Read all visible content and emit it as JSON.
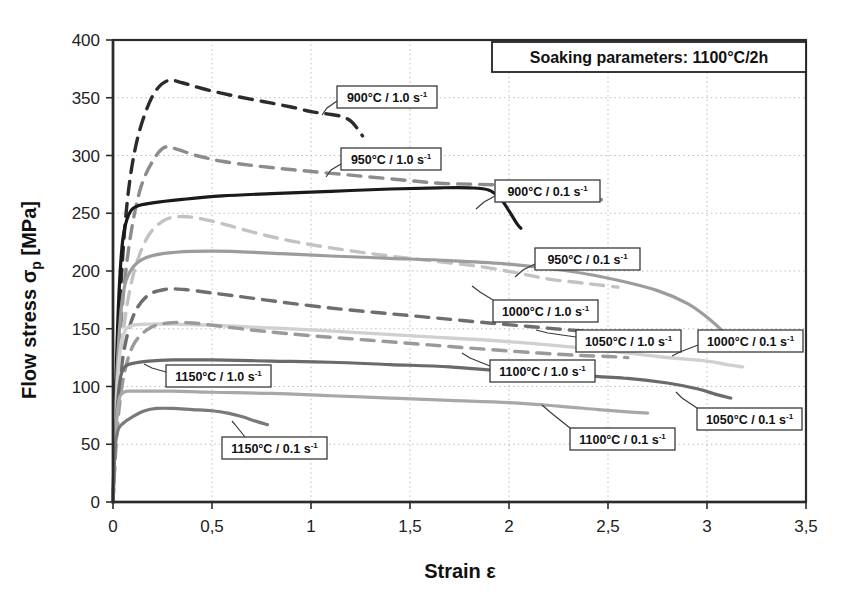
{
  "chart_data": {
    "type": "line",
    "title": "Soaking parameters:  1100°C/2h",
    "xlabel": "Strain ε",
    "ylabel": "Flow stress σp [MPa]",
    "xlim": [
      0,
      3.5
    ],
    "ylim": [
      0,
      400
    ],
    "xticks": [
      "0",
      "0,5",
      "1",
      "1,5",
      "2",
      "2,5",
      "3",
      "3,5"
    ],
    "xtick_values": [
      0,
      0.5,
      1,
      1.5,
      2,
      2.5,
      3,
      3.5
    ],
    "yticks": [
      "0",
      "50",
      "100",
      "150",
      "200",
      "250",
      "300",
      "350",
      "400"
    ],
    "ytick_values": [
      0,
      50,
      100,
      150,
      200,
      250,
      300,
      350,
      400
    ],
    "grid": true,
    "legend_position": "inline-callouts",
    "series": [
      {
        "name": "900°C / 1.0 s",
        "label": "900°C / 1.0 s",
        "exponent": "-1",
        "color": "#2b2b2b",
        "width": 3.4,
        "dash": "13 9",
        "points": [
          [
            0,
            0
          ],
          [
            0.02,
            120
          ],
          [
            0.05,
            215
          ],
          [
            0.08,
            272
          ],
          [
            0.12,
            312
          ],
          [
            0.17,
            340
          ],
          [
            0.22,
            357
          ],
          [
            0.28,
            365
          ],
          [
            0.35,
            363
          ],
          [
            0.45,
            358
          ],
          [
            0.6,
            352
          ],
          [
            0.75,
            347
          ],
          [
            0.9,
            342
          ],
          [
            1.0,
            338
          ],
          [
            1.08,
            336
          ],
          [
            1.15,
            334
          ],
          [
            1.2,
            330
          ],
          [
            1.24,
            322
          ],
          [
            1.26,
            317
          ]
        ]
      },
      {
        "name": "950°C / 1.0 s",
        "label": "950°C / 1.0 s",
        "exponent": "-1",
        "color": "#8c8c8c",
        "width": 3.4,
        "dash": "13 9",
        "points": [
          [
            0,
            0
          ],
          [
            0.02,
            95
          ],
          [
            0.05,
            175
          ],
          [
            0.09,
            232
          ],
          [
            0.14,
            272
          ],
          [
            0.2,
            295
          ],
          [
            0.26,
            307
          ],
          [
            0.33,
            305
          ],
          [
            0.42,
            300
          ],
          [
            0.55,
            295
          ],
          [
            0.72,
            291
          ],
          [
            0.95,
            287
          ],
          [
            1.2,
            283
          ],
          [
            1.45,
            279
          ],
          [
            1.65,
            276
          ],
          [
            1.85,
            275
          ],
          [
            2.0,
            274
          ],
          [
            2.15,
            272
          ],
          [
            2.3,
            268
          ],
          [
            2.42,
            263
          ],
          [
            2.5,
            261
          ]
        ]
      },
      {
        "name": "900°C / 0.1 s",
        "label": "900°C / 0.1 s",
        "exponent": "-1",
        "color": "#1a1a1a",
        "width": 3.2,
        "dash": "none",
        "points": [
          [
            0,
            0
          ],
          [
            0.015,
            105
          ],
          [
            0.03,
            180
          ],
          [
            0.05,
            228
          ],
          [
            0.08,
            249
          ],
          [
            0.12,
            256
          ],
          [
            0.2,
            259
          ],
          [
            0.35,
            262
          ],
          [
            0.55,
            265
          ],
          [
            0.8,
            267
          ],
          [
            1.1,
            269
          ],
          [
            1.4,
            271
          ],
          [
            1.65,
            272
          ],
          [
            1.8,
            272
          ],
          [
            1.9,
            270
          ],
          [
            1.96,
            262
          ],
          [
            2.0,
            252
          ],
          [
            2.04,
            241
          ],
          [
            2.06,
            237
          ]
        ]
      },
      {
        "name": "950°C / 0.1 s",
        "label": "950°C / 0.1 s",
        "exponent": "-1",
        "color": "#c2c2c2",
        "width": 3.4,
        "dash": "13 9",
        "points": [
          [
            0,
            0
          ],
          [
            0.02,
            80
          ],
          [
            0.05,
            145
          ],
          [
            0.1,
            195
          ],
          [
            0.17,
            228
          ],
          [
            0.25,
            243
          ],
          [
            0.33,
            247
          ],
          [
            0.42,
            246
          ],
          [
            0.55,
            241
          ],
          [
            0.72,
            233
          ],
          [
            0.9,
            226
          ],
          [
            1.1,
            220
          ],
          [
            1.35,
            214
          ],
          [
            1.6,
            209
          ],
          [
            1.85,
            204
          ],
          [
            2.05,
            198
          ],
          [
            2.2,
            193
          ],
          [
            2.35,
            190
          ],
          [
            2.45,
            188
          ],
          [
            2.55,
            186
          ]
        ]
      },
      {
        "name": "1000°C / 1.0 s",
        "label": "1000°C / 1.0 s",
        "exponent": "-1",
        "color": "#9c9c9c",
        "width": 3.2,
        "dash": "none",
        "points": [
          [
            0,
            0
          ],
          [
            0.015,
            90
          ],
          [
            0.035,
            155
          ],
          [
            0.06,
            188
          ],
          [
            0.1,
            203
          ],
          [
            0.16,
            211
          ],
          [
            0.25,
            215
          ],
          [
            0.4,
            217
          ],
          [
            0.6,
            217
          ],
          [
            0.85,
            215
          ],
          [
            1.1,
            213
          ],
          [
            1.4,
            211
          ],
          [
            1.7,
            209
          ],
          [
            2.0,
            206
          ],
          [
            2.3,
            200
          ],
          [
            2.55,
            192
          ],
          [
            2.75,
            183
          ],
          [
            2.9,
            172
          ],
          [
            3.0,
            160
          ],
          [
            3.08,
            148
          ],
          [
            3.13,
            140
          ],
          [
            3.16,
            133
          ]
        ]
      },
      {
        "name": "1050°C / 1.0 s",
        "label": "1050°C / 1.0 s",
        "exponent": "-1",
        "color": "#6e6e6e",
        "width": 3.4,
        "dash": "13 9",
        "points": [
          [
            0,
            0
          ],
          [
            0.02,
            70
          ],
          [
            0.05,
            125
          ],
          [
            0.1,
            160
          ],
          [
            0.17,
            178
          ],
          [
            0.26,
            184
          ],
          [
            0.36,
            184
          ],
          [
            0.5,
            181
          ],
          [
            0.68,
            177
          ],
          [
            0.9,
            172
          ],
          [
            1.15,
            167
          ],
          [
            1.4,
            163
          ],
          [
            1.65,
            159
          ],
          [
            1.9,
            155
          ],
          [
            2.1,
            152
          ],
          [
            2.3,
            149
          ],
          [
            2.45,
            147
          ],
          [
            2.55,
            145
          ]
        ]
      },
      {
        "name": "1000°C / 0.1 s",
        "label": "1000°C / 0.1 s",
        "exponent": "-1",
        "color": "#d0d0d0",
        "width": 3.4,
        "dash": "none",
        "points": [
          [
            0,
            0
          ],
          [
            0.015,
            80
          ],
          [
            0.035,
            130
          ],
          [
            0.06,
            148
          ],
          [
            0.1,
            153
          ],
          [
            0.18,
            154
          ],
          [
            0.3,
            154
          ],
          [
            0.5,
            153
          ],
          [
            0.75,
            151
          ],
          [
            1.0,
            149
          ],
          [
            1.3,
            146
          ],
          [
            1.6,
            143
          ],
          [
            1.9,
            140
          ],
          [
            2.2,
            136
          ],
          [
            2.5,
            131
          ],
          [
            2.75,
            126
          ],
          [
            3.0,
            122
          ],
          [
            3.1,
            119
          ],
          [
            3.18,
            117
          ]
        ]
      },
      {
        "name": "1100°C / 1.0 s",
        "label": "1100°C / 1.0 s",
        "exponent": "-1",
        "color": "#9a9a9a",
        "width": 3.4,
        "dash": "13 9",
        "points": [
          [
            0,
            0
          ],
          [
            0.02,
            60
          ],
          [
            0.05,
            105
          ],
          [
            0.1,
            135
          ],
          [
            0.18,
            150
          ],
          [
            0.28,
            155
          ],
          [
            0.4,
            155
          ],
          [
            0.55,
            152
          ],
          [
            0.75,
            148
          ],
          [
            1.0,
            144
          ],
          [
            1.3,
            140
          ],
          [
            1.6,
            136
          ],
          [
            1.9,
            132
          ],
          [
            2.15,
            129
          ],
          [
            2.35,
            127
          ],
          [
            2.5,
            126
          ],
          [
            2.6,
            125
          ]
        ]
      },
      {
        "name": "1150°C / 1.0 s",
        "label": "1150°C / 1.0 s",
        "exponent": "-1",
        "color": "#6a6a6a",
        "width": 3.2,
        "dash": "none",
        "points": [
          [
            0,
            0
          ],
          [
            0.015,
            65
          ],
          [
            0.035,
            105
          ],
          [
            0.06,
            117
          ],
          [
            0.1,
            120
          ],
          [
            0.18,
            122
          ],
          [
            0.3,
            123
          ],
          [
            0.5,
            123
          ],
          [
            0.8,
            122
          ],
          [
            1.1,
            121
          ],
          [
            1.4,
            119
          ],
          [
            1.7,
            117
          ],
          [
            2.0,
            113
          ],
          [
            2.3,
            110
          ],
          [
            2.6,
            107
          ],
          [
            2.8,
            103
          ],
          [
            2.95,
            98
          ],
          [
            3.05,
            93
          ],
          [
            3.12,
            90
          ]
        ]
      },
      {
        "name": "1100°C / 0.1 s",
        "label": "1100°C / 0.1 s",
        "exponent": "-1",
        "color": "#a8a8a8",
        "width": 3.2,
        "dash": "none",
        "points": [
          [
            0,
            0
          ],
          [
            0.012,
            55
          ],
          [
            0.03,
            88
          ],
          [
            0.055,
            95
          ],
          [
            0.09,
            96
          ],
          [
            0.16,
            96
          ],
          [
            0.3,
            96
          ],
          [
            0.5,
            95
          ],
          [
            0.8,
            94
          ],
          [
            1.1,
            92
          ],
          [
            1.4,
            90
          ],
          [
            1.7,
            88
          ],
          [
            2.0,
            86
          ],
          [
            2.25,
            83
          ],
          [
            2.45,
            80
          ],
          [
            2.6,
            78
          ],
          [
            2.7,
            77
          ]
        ]
      },
      {
        "name": "1150°C / 0.1 s",
        "label": "1150°C / 0.1 s",
        "exponent": "-1",
        "color": "#7a7a7a",
        "width": 3.2,
        "dash": "none",
        "points": [
          [
            0,
            0
          ],
          [
            0.01,
            45
          ],
          [
            0.025,
            62
          ],
          [
            0.05,
            68
          ],
          [
            0.1,
            74
          ],
          [
            0.16,
            79
          ],
          [
            0.22,
            81
          ],
          [
            0.3,
            81
          ],
          [
            0.4,
            80
          ],
          [
            0.5,
            79
          ],
          [
            0.58,
            77
          ],
          [
            0.65,
            74
          ],
          [
            0.72,
            70
          ],
          [
            0.78,
            67
          ]
        ]
      }
    ],
    "annotations": [
      {
        "id": "a1",
        "label": "900°C / 1.0 s",
        "exponent": "-1",
        "box": [
          337,
          86,
          100,
          22
        ],
        "leader": [
          [
            337,
            101
          ],
          [
            327,
            108
          ],
          [
            322,
            115
          ]
        ]
      },
      {
        "id": "a2",
        "label": "950°C / 1.0 s",
        "exponent": "-1",
        "box": [
          341,
          148,
          100,
          22
        ],
        "leader": [
          [
            341,
            164
          ],
          [
            331,
            170
          ],
          [
            326,
            177
          ]
        ]
      },
      {
        "id": "a3",
        "label": "900°C / 0.1 s",
        "exponent": "-1",
        "box": [
          495,
          180,
          105,
          22
        ],
        "leader": [
          [
            495,
            196
          ],
          [
            484,
            202
          ],
          [
            476,
            209
          ]
        ]
      },
      {
        "id": "a4",
        "label": "950°C / 0.1 s",
        "exponent": "-1",
        "box": [
          535,
          248,
          105,
          22
        ],
        "leader": [
          [
            535,
            264
          ],
          [
            523,
            270
          ],
          [
            515,
            277
          ]
        ]
      },
      {
        "id": "a5",
        "label": "1000°C / 1.0 s",
        "exponent": "-1",
        "box": [
          493,
          300,
          105,
          22
        ],
        "leader": [
          [
            493,
            300
          ],
          [
            480,
            292
          ],
          [
            472,
            286
          ]
        ]
      },
      {
        "id": "a6",
        "label": "1050°C / 1.0 s",
        "exponent": "-1",
        "box": [
          576,
          330,
          105,
          22
        ],
        "leader": [
          [
            576,
            337
          ],
          [
            548,
            333
          ],
          [
            536,
            330
          ]
        ]
      },
      {
        "id": "a7",
        "label": "1000°C / 0.1 s",
        "exponent": "-1",
        "box": [
          698,
          330,
          105,
          22
        ],
        "leader": [
          [
            698,
            345
          ],
          [
            680,
            352
          ],
          [
            672,
            356
          ]
        ]
      },
      {
        "id": "a8",
        "label": "1100°C / 1.0 s",
        "exponent": "-1",
        "box": [
          490,
          360,
          105,
          22
        ],
        "leader": [
          [
            490,
            366
          ],
          [
            470,
            358
          ],
          [
            462,
            353
          ]
        ]
      },
      {
        "id": "a9",
        "label": "1150°C / 1.0 s",
        "exponent": "-1",
        "box": [
          166,
          365,
          105,
          22
        ],
        "leader": [
          [
            166,
            372
          ],
          [
            152,
            368
          ],
          [
            144,
            364
          ]
        ]
      },
      {
        "id": "a10",
        "label": "1050°C / 0.1 s",
        "exponent": "-1",
        "box": [
          697,
          408,
          105,
          22
        ],
        "leader": [
          [
            697,
            408
          ],
          [
            682,
            398
          ],
          [
            676,
            392
          ]
        ]
      },
      {
        "id": "a11",
        "label": "1100°C / 0.1 s",
        "exponent": "-1",
        "box": [
          570,
          428,
          105,
          22
        ],
        "leader": [
          [
            570,
            428
          ],
          [
            550,
            412
          ],
          [
            542,
            405
          ]
        ]
      },
      {
        "id": "a12",
        "label": "1150°C / 0.1 s",
        "exponent": "-1",
        "box": [
          222,
          437,
          105,
          22
        ],
        "leader": [
          [
            245,
            437
          ],
          [
            237,
            427
          ],
          [
            232,
            421
          ]
        ]
      }
    ]
  },
  "plot": {
    "left": 113,
    "right": 806,
    "top": 40,
    "bottom": 502
  },
  "title_box": {
    "x": 492,
    "y": 42,
    "w": 314,
    "h": 30
  }
}
